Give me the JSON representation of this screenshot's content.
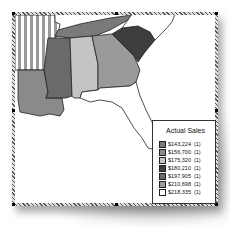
{
  "legend": {
    "title": "Actual Sales",
    "items": [
      {
        "label": "$143,224",
        "count": "(1)",
        "color": "#7a7a7a"
      },
      {
        "label": "$156,700",
        "count": "(1)",
        "color": "#8a8a8a"
      },
      {
        "label": "$175,320",
        "count": "(1)",
        "color": "#c4c4c4"
      },
      {
        "label": "$180,210",
        "count": "(1)",
        "color": "#3e3e3e"
      },
      {
        "label": "$197,905",
        "count": "(1)",
        "color": "#6a6a6a"
      },
      {
        "label": "$210,698",
        "count": "(1)",
        "color": "#9a9a9a"
      },
      {
        "label": "$218,335",
        "count": "(1)",
        "color": "#ffffff"
      }
    ]
  },
  "states": [
    {
      "name": "Arkansas",
      "fill": "striped"
    },
    {
      "name": "Tennessee",
      "fill": "#7a7a7a"
    },
    {
      "name": "Louisiana",
      "fill": "#8a8a8a"
    },
    {
      "name": "Mississippi",
      "fill": "#6a6a6a"
    },
    {
      "name": "Alabama",
      "fill": "#c4c4c4"
    },
    {
      "name": "Georgia",
      "fill": "#9a9a9a"
    },
    {
      "name": "South Carolina",
      "fill": "#3e3e3e"
    },
    {
      "name": "Florida",
      "fill": "#ffffff"
    }
  ]
}
